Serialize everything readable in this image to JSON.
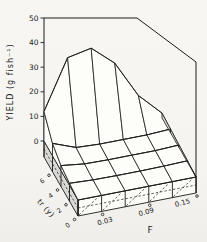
{
  "chart_data": {
    "type": "surface",
    "title": "",
    "zlabel": "YIELD (g fish⁻¹)",
    "xlabel": "F",
    "ylabel": "tr (y)",
    "zlim": [
      0,
      50
    ],
    "z_ticks": [
      "50",
      "40",
      "30",
      "20",
      "10",
      "0"
    ],
    "x_ticks": [
      "0.03",
      "0.09",
      "0.15"
    ],
    "x_values": [
      0,
      0.03,
      0.06,
      0.09,
      0.12,
      0.15
    ],
    "y_ticks": [
      "6",
      "4",
      "2",
      "0"
    ],
    "grid": "5 columns (F) by 4 rows (tr) base lattice, hidden edges dashed",
    "legend": "none",
    "rows": [
      {
        "tr_label": "",
        "values": [
          12,
          32,
          34,
          26,
          11,
          2
        ]
      },
      {
        "tr_label": "6",
        "values": [
          5,
          1.5,
          1,
          1,
          1,
          1.5
        ]
      },
      {
        "tr_label": "4",
        "values": [
          2,
          0.8,
          0.6,
          0.6,
          0.6,
          1
        ]
      },
      {
        "tr_label": "2",
        "values": [
          0.8,
          0.3,
          0.2,
          0.2,
          0.3,
          0.6
        ]
      },
      {
        "tr_label": "0",
        "values": [
          0,
          0,
          0,
          0,
          0,
          0
        ]
      }
    ],
    "units": "g fish⁻¹",
    "peak_value": 34,
    "peak_location": {
      "F": 0.06,
      "row": "back (largest tr)"
    }
  },
  "colors": {
    "line": "#1b1b1b",
    "shade": "#d8d8d5",
    "face": "#fcfcf9",
    "background": "#f6f5f2"
  }
}
